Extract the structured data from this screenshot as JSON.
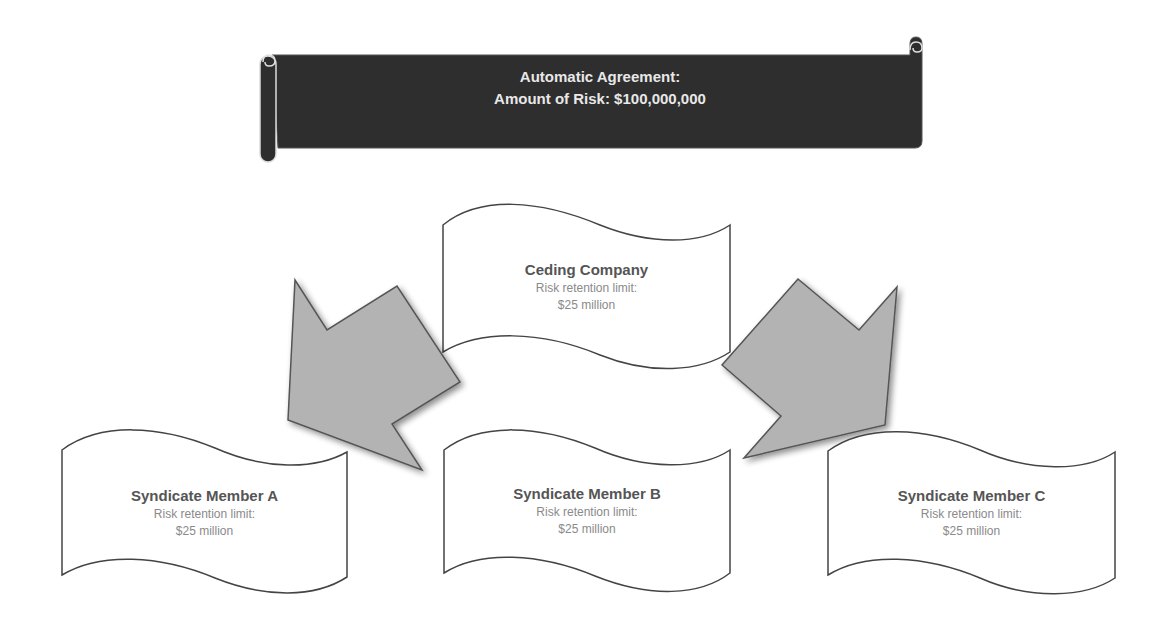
{
  "banner": {
    "line1": "Automatic Agreement:",
    "line2": "Amount of Risk: $100,000,000",
    "fill_color": "#2e2e2e",
    "text_color": "#e8e8e8"
  },
  "ceding": {
    "title": "Ceding Company",
    "line1": "Risk retention limit:",
    "line2": "$25 million"
  },
  "members": [
    {
      "title": "Syndicate Member A",
      "line1": "Risk retention limit:",
      "line2": "$25 million"
    },
    {
      "title": "Syndicate Member B",
      "line1": "Risk retention limit:",
      "line2": "$25 million"
    },
    {
      "title": "Syndicate Member C",
      "line1": "Risk retention limit:",
      "line2": "$25 million"
    }
  ],
  "arrows": [
    {
      "name": "left-bent-arrow",
      "direction": "down-left",
      "fill_color": "#b3b3b3"
    },
    {
      "name": "right-bent-arrow",
      "direction": "down-right",
      "fill_color": "#b3b3b3"
    }
  ]
}
